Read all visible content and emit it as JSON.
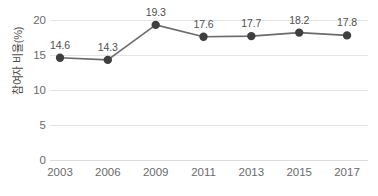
{
  "chart_data": {
    "type": "line",
    "title": "",
    "xlabel": "",
    "ylabel": "참여자 비율(%)",
    "categories": [
      "2003",
      "2006",
      "2009",
      "2011",
      "2013",
      "2015",
      "2017"
    ],
    "values": [
      14.6,
      14.3,
      19.3,
      17.6,
      17.7,
      18.2,
      17.8
    ],
    "point_labels": [
      "14.6",
      "14.3",
      "19.3",
      "17.6",
      "17.7",
      "18.2",
      "17.8"
    ],
    "ylim": [
      0,
      20
    ],
    "yticks": [
      0,
      5,
      10,
      15,
      20
    ],
    "ytick_labels": [
      "0",
      "5",
      "10",
      "15",
      "20"
    ],
    "grid": true,
    "legend": "none",
    "series": [
      {
        "name": "참여자 비율(%)",
        "values": [
          14.6,
          14.3,
          19.3,
          17.6,
          17.7,
          18.2,
          17.8
        ]
      }
    ],
    "colors": {
      "line": "#6b6b6b",
      "marker": "#3f3f3f",
      "grid": "#e4e4e4",
      "text": "#5b5b5b",
      "background": "#ffffff"
    }
  }
}
